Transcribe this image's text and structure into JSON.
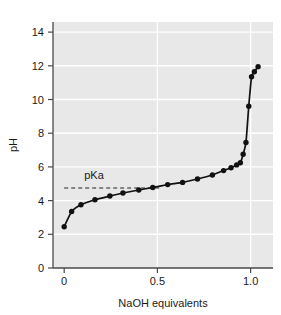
{
  "chart_data": {
    "type": "line",
    "title": "",
    "subtitle": "",
    "xlabel": "NaOH equivalents",
    "ylabel": "pH",
    "xlim": [
      -0.06,
      1.12
    ],
    "ylim": [
      0,
      14.6
    ],
    "xticks": [
      0,
      0.5,
      1.0
    ],
    "xticklabels": [
      "0",
      "0.5",
      "1.0"
    ],
    "yticks": [
      0,
      2,
      4,
      6,
      8,
      10,
      12,
      14
    ],
    "yticklabels": [
      "0",
      "2",
      "4",
      "6",
      "8",
      "10",
      "12",
      "14"
    ],
    "grid": true,
    "grid_color": "#ffffff",
    "plot_background": "#e8e8e8",
    "figure_background": "#ffffff",
    "legend": null,
    "legend_position": "none",
    "series": [
      {
        "name": "Titration curve",
        "marker": "circle",
        "marker_color": "#111111",
        "line_color": "#111111",
        "x": [
          0.0,
          0.04,
          0.09,
          0.165,
          0.245,
          0.315,
          0.4,
          0.475,
          0.555,
          0.635,
          0.715,
          0.795,
          0.855,
          0.895,
          0.925,
          0.945,
          0.96,
          0.975,
          0.99,
          1.005,
          1.02,
          1.04
        ],
        "y": [
          2.45,
          3.35,
          3.75,
          4.05,
          4.27,
          4.45,
          4.63,
          4.78,
          4.95,
          5.08,
          5.28,
          5.52,
          5.78,
          5.95,
          6.12,
          6.25,
          6.75,
          7.45,
          9.6,
          11.35,
          11.65,
          11.95
        ]
      }
    ],
    "annotations": [
      {
        "name": "pKa",
        "label": "pKa",
        "type": "horizontal-dashed-line",
        "y_value": 4.75,
        "x_start": 0.0,
        "x_end": 0.52,
        "label_x": 0.16,
        "label_y": 5.3,
        "color": "#222222",
        "dash": "4 3"
      }
    ]
  },
  "axes": {
    "y_axis_title": "pH",
    "x_axis_title": "NaOH equivalents"
  }
}
